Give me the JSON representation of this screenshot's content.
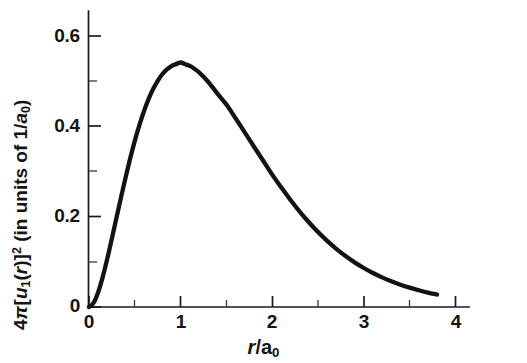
{
  "figure": {
    "background_color": "#ffffff",
    "curve_color": "#131313",
    "axis_color": "#1a1a1a"
  },
  "axes": {
    "x": {
      "title_parts": {
        "variable": "r",
        "slash": "/",
        "unit": "a",
        "unit_sub": "0"
      },
      "title_text": "r/a0",
      "tick_labels": [
        "0",
        "1",
        "2",
        "3",
        "4"
      ],
      "tick_values": [
        0,
        1,
        2,
        3,
        4
      ],
      "minor_tick_values": [
        0.5,
        1.5,
        2.5,
        3.5
      ],
      "range": [
        0,
        4.1
      ]
    },
    "y": {
      "title_parts": {
        "coef": "4",
        "pi": "π",
        "bracket_open": "[",
        "func": "u",
        "func_sub": "1",
        "paren_open": "(",
        "arg": "r",
        "paren_close": ")",
        "bracket_close": "]",
        "power": "2",
        "units_open": " (in units of 1/",
        "unit_a": "a",
        "unit_sub": "0",
        "units_close": ")"
      },
      "title_text": "4π[u1(r)]2 (in units of 1/a0)",
      "tick_labels": [
        "0",
        "0.2",
        "0.4",
        "0.6"
      ],
      "tick_values": [
        0,
        0.2,
        0.4,
        0.6
      ],
      "minor_tick_values": [
        0.1,
        0.3,
        0.5
      ],
      "range": [
        0,
        0.665
      ]
    }
  },
  "chart_data": {
    "type": "line",
    "title": "",
    "subtitle": "",
    "xlabel": "r/a0",
    "ylabel": "4π[u1(r)]2 (in units of 1/a0)",
    "xlim": [
      0,
      4.1
    ],
    "ylim": [
      0,
      0.665
    ],
    "grid": false,
    "legend": null,
    "annotations": [],
    "peak": {
      "x": 1.0,
      "y": 0.541
    },
    "series": [
      {
        "name": "4π[u1(r)]2",
        "x": [
          0,
          0.05,
          0.1,
          0.15,
          0.2,
          0.25,
          0.3,
          0.35,
          0.4,
          0.45,
          0.5,
          0.55,
          0.6,
          0.65,
          0.7,
          0.75,
          0.8,
          0.85,
          0.9,
          0.95,
          1.0,
          1.05,
          1.1,
          1.15,
          1.2,
          1.3,
          1.4,
          1.5,
          1.6,
          1.7,
          1.8,
          1.9,
          2.0,
          2.1,
          2.2,
          2.3,
          2.4,
          2.5,
          2.6,
          2.7,
          2.8,
          2.9,
          3.0,
          3.1,
          3.2,
          3.3,
          3.4,
          3.5,
          3.6,
          3.7,
          3.8
        ],
        "y": [
          0.0,
          0.00905,
          0.03275,
          0.06667,
          0.10725,
          0.15163,
          0.19756,
          0.24329,
          0.28747,
          0.32909,
          0.36788,
          0.40266,
          0.43347,
          0.46005,
          0.48247,
          0.50083,
          0.5153,
          0.5261,
          0.53348,
          0.5377,
          0.54134,
          0.53735,
          0.53373,
          0.52767,
          0.51967,
          0.49871,
          0.473,
          0.44808,
          0.4179,
          0.3867,
          0.35537,
          0.32441,
          0.29305,
          0.26438,
          0.23697,
          0.21135,
          0.18766,
          0.166,
          0.14634,
          0.12866,
          0.11289,
          0.09881,
          0.08637,
          0.07532,
          0.06557,
          0.05697,
          0.04943,
          0.04282,
          0.03704,
          0.032,
          0.02761
        ]
      }
    ]
  }
}
